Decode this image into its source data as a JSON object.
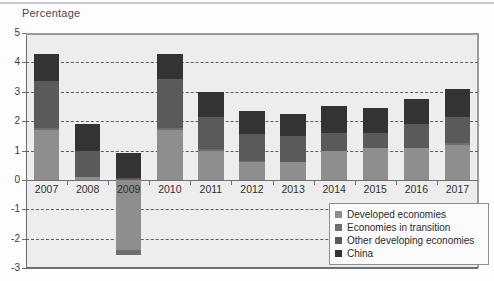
{
  "chart_title": "Percentage",
  "chart_data": {
    "type": "bar",
    "subtype": "stacked-bar",
    "title": "Percentage",
    "xlabel": "",
    "ylabel": "Percentage",
    "ylim": [
      -3,
      5
    ],
    "yticks": [
      5,
      4,
      3,
      2,
      1,
      0,
      -1,
      -2,
      -3
    ],
    "ytick_labels": [
      "5",
      "4",
      "3",
      "2",
      "1",
      "0",
      "-1",
      "-2",
      "-3"
    ],
    "grid": true,
    "grid_style": "dashed-horizontal",
    "legend_position": "bottom-right",
    "categories": [
      "2007",
      "2008",
      "2009",
      "2010",
      "2011",
      "2012",
      "2013",
      "2014",
      "2015",
      "2016",
      "2017"
    ],
    "series": [
      {
        "name": "Developed economies",
        "color": "#8e8e8e",
        "values": [
          1.7,
          0.1,
          -2.4,
          1.7,
          1.0,
          0.6,
          0.6,
          1.0,
          1.1,
          1.1,
          1.2
        ]
      },
      {
        "name": "Economies in transition",
        "color": "#6e6e6e",
        "values": [
          0.05,
          0.0,
          -0.15,
          0.05,
          0.05,
          0.05,
          0.0,
          0.0,
          -0.05,
          0.0,
          0.05
        ]
      },
      {
        "name": "Other developing economies",
        "color": "#5a5a5a",
        "values": [
          1.6,
          0.9,
          0.05,
          1.7,
          1.1,
          0.9,
          0.9,
          0.6,
          0.5,
          0.8,
          0.9
        ]
      },
      {
        "name": "China",
        "color": "#333333",
        "values": [
          0.95,
          0.9,
          0.85,
          0.85,
          0.85,
          0.8,
          0.75,
          0.9,
          0.85,
          0.85,
          0.95
        ]
      }
    ],
    "totals": [
      4.3,
      1.9,
      0.9,
      4.3,
      3.0,
      2.3,
      2.25,
      2.5,
      2.4,
      2.75,
      3.1
    ],
    "negative_totals": [
      0,
      0,
      -2.55,
      0,
      0,
      0,
      0,
      0,
      0,
      0,
      0
    ]
  },
  "legend": {
    "items": [
      {
        "label": "Developed economies",
        "color": "#8e8e8e"
      },
      {
        "label": "Economies in transition",
        "color": "#6e6e6e"
      },
      {
        "label": "Other developing economies",
        "color": "#5a5a5a"
      },
      {
        "label": "China",
        "color": "#333333"
      }
    ]
  },
  "colors": {
    "plot_background": "#ededed",
    "page_background": "#fdfdfd",
    "axis": "#6f6f6f",
    "gridline": "#5b5b5b",
    "text": "#2d2d2d"
  }
}
